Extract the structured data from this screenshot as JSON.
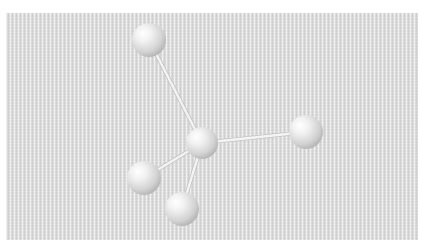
{
  "diagram": {
    "type": "ball-and-stick molecular model",
    "geometry": "tetrahedral",
    "colors": {
      "background_panel": "#d9d9d9",
      "page": "#ffffff",
      "bond": "#f4f4f4",
      "atom_highlight": "#ffffff",
      "atom_mid": "#e2e2e2",
      "atom_shadow": "#a8a8a8"
    },
    "central_atom": {
      "id": "center",
      "cx": 202,
      "cy": 143,
      "r": 16
    },
    "outer_atoms": [
      {
        "id": "top",
        "cx": 149,
        "cy": 40,
        "r": 17
      },
      {
        "id": "right",
        "cx": 306,
        "cy": 132,
        "r": 17
      },
      {
        "id": "lower-left",
        "cx": 144,
        "cy": 178,
        "r": 17
      },
      {
        "id": "bottom",
        "cx": 182,
        "cy": 209,
        "r": 17
      }
    ],
    "bonds": [
      {
        "from": "center",
        "to": "top"
      },
      {
        "from": "center",
        "to": "right"
      },
      {
        "from": "center",
        "to": "lower-left"
      },
      {
        "from": "center",
        "to": "bottom"
      }
    ]
  }
}
